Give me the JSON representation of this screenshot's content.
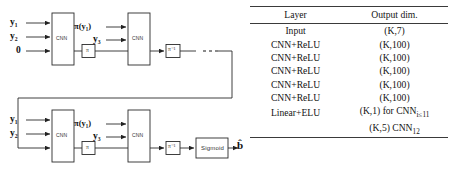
{
  "figure": {
    "diagram": {
      "stage_top": {
        "inputs": [
          "y₁",
          "y₂",
          "0"
        ],
        "block1_label": "CNN",
        "interleaver_label": "π",
        "mid_inputs": [
          "π(y₁)",
          "y₃"
        ],
        "block2_label": "CNN",
        "deinterleaver_label": "π⁻¹",
        "continuation": "· · ·"
      },
      "stage_bottom": {
        "inputs": [
          "y₁",
          "y₂"
        ],
        "block1_label": "CNN",
        "interleaver_label": "π",
        "mid_inputs": [
          "π(y₁)",
          "y₃"
        ],
        "block2_label": "CNN",
        "deinterleaver_label": "π⁻¹",
        "activation_label": "Sigmoid",
        "output_label": "b̂"
      }
    },
    "table": {
      "headers": [
        "Layer",
        "Output dim."
      ],
      "rows": [
        {
          "layer": "Input",
          "dim": "(K,7)"
        },
        {
          "layer": "CNN+ReLU",
          "dim": "(K,100)"
        },
        {
          "layer": "CNN+ReLU",
          "dim": "(K,100)"
        },
        {
          "layer": "CNN+ReLU",
          "dim": "(K,100)"
        },
        {
          "layer": "CNN+ReLU",
          "dim": "(K,100)"
        },
        {
          "layer": "CNN+ReLU",
          "dim": "(K,100)"
        },
        {
          "layer": "Linear+ELU",
          "dim": "(K,1) for CNN"
        }
      ],
      "last_row_sub": "i≤11",
      "extra_row_prefix": "(K,5) CNN",
      "extra_row_sub": "12"
    }
  }
}
